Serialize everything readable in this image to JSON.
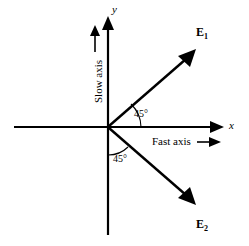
{
  "figure": {
    "type": "vector-diagram",
    "stroke_color": "#000000",
    "background_color": "#ffffff"
  },
  "axes": {
    "x_label": "x",
    "y_label": "y",
    "origin": {
      "x": 108,
      "y": 127
    }
  },
  "annotations": {
    "slow_axis": "Slow axis",
    "fast_axis": "Fast axis"
  },
  "vectors": [
    {
      "id": "E1",
      "label": "E",
      "subscript": "1",
      "angle_from_x_axis_deg": 45,
      "quadrant": "upper-right"
    },
    {
      "id": "E2",
      "label": "E",
      "subscript": "2",
      "angle_from_x_axis_deg": -45,
      "quadrant": "lower-right"
    }
  ],
  "angles": [
    {
      "id": "angle-upper",
      "value": "45°",
      "between": "x-axis and E1"
    },
    {
      "id": "angle-lower",
      "value": "45°",
      "between": "negative y-axis and E2"
    }
  ]
}
